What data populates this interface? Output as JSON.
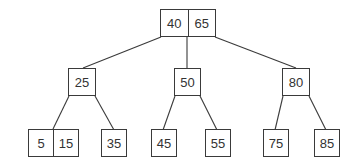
{
  "diagram": {
    "type": "B-tree (2-3 tree)",
    "root": {
      "keys": [
        "40",
        "65"
      ]
    },
    "internal": [
      {
        "keys": [
          "25"
        ]
      },
      {
        "keys": [
          "50"
        ]
      },
      {
        "keys": [
          "80"
        ]
      }
    ],
    "leaves": [
      {
        "keys": [
          "5",
          "15"
        ]
      },
      {
        "keys": [
          "35"
        ]
      },
      {
        "keys": [
          "45"
        ]
      },
      {
        "keys": [
          "55"
        ]
      },
      {
        "keys": [
          "75"
        ]
      },
      {
        "keys": [
          "85"
        ]
      }
    ],
    "colors": {
      "stroke": "#3a3a3a",
      "text": "#333333",
      "background": "#ffffff"
    }
  }
}
